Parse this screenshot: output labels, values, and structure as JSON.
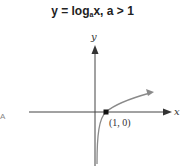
{
  "title": {
    "lhs": "y = log",
    "base": "a",
    "rhs": "x, a > 1"
  },
  "axes": {
    "x_label": "x",
    "y_label": "y"
  },
  "point": {
    "label": "(1, 0)",
    "color": "#111111"
  },
  "curve": {
    "color": "#8a8a8a",
    "description": "logarithmic curve, a > 1, vertical asymptote at y-axis"
  },
  "colors": {
    "axis": "#444444",
    "curve": "#8a8a8a"
  },
  "edge_glyph": "A"
}
